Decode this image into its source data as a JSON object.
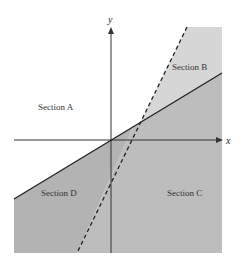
{
  "diagram": {
    "axes": {
      "x_label": "x",
      "y_label": "y"
    },
    "sections": [
      {
        "id": "A",
        "label": "Section A"
      },
      {
        "id": "B",
        "label": "Section B"
      },
      {
        "id": "C",
        "label": "Section C"
      },
      {
        "id": "D",
        "label": "Section D"
      }
    ],
    "lines": [
      {
        "name": "solid-line",
        "style": "solid"
      },
      {
        "name": "dashed-line",
        "style": "dashed"
      }
    ],
    "colors": {
      "light_shade": "#d4d4d4",
      "dark_shade": "#b4b4b4",
      "line": "#222222",
      "background": "#ffffff"
    }
  }
}
